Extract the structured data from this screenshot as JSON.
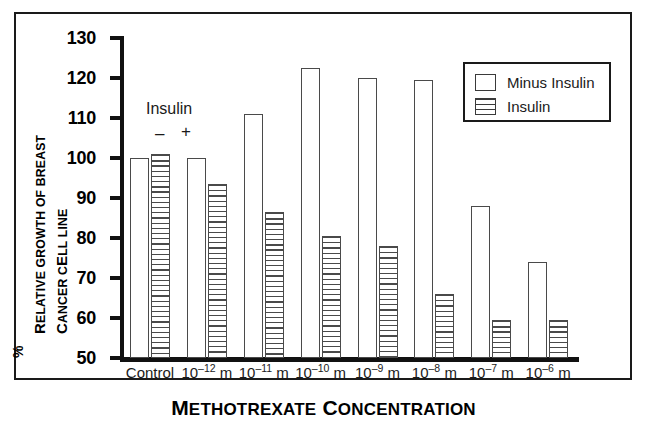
{
  "chart_data": {
    "type": "bar",
    "title": "",
    "xlabel": "Methotrexate Concentration",
    "ylabel": "% Relative Growth of Breast Cancer Cell Line",
    "ylim": [
      50,
      130
    ],
    "ytick_values": [
      130,
      120,
      110,
      100,
      90,
      80,
      70,
      60,
      50
    ],
    "ytick_labels": [
      "130",
      "120",
      "110",
      "100",
      "90",
      "80",
      "70",
      "60",
      "50"
    ],
    "grid": false,
    "legend_position": "top-right",
    "categories": [
      "Control",
      "10-12 m",
      "10-11 m",
      "10-10 m",
      "10-9 m",
      "10-8 m",
      "10-7 m",
      "10-6 m"
    ],
    "category_labels": [
      {
        "base": "Control",
        "exp": ""
      },
      {
        "base": "10",
        "exp": "–12",
        "unit": " m"
      },
      {
        "base": "10",
        "exp": "–11",
        "unit": " m"
      },
      {
        "base": "10",
        "exp": "–10",
        "unit": " m"
      },
      {
        "base": "10",
        "exp": "–9",
        "unit": " m"
      },
      {
        "base": "10",
        "exp": "–8",
        "unit": " m"
      },
      {
        "base": "10",
        "exp": "–7",
        "unit": " m"
      },
      {
        "base": "10",
        "exp": "–6",
        "unit": " m"
      }
    ],
    "series": [
      {
        "name": "Minus Insulin",
        "fill": "white",
        "values": [
          100,
          100,
          111,
          122.5,
          120,
          119.5,
          88,
          74
        ]
      },
      {
        "name": "Insulin",
        "fill": "horizontal-stripes",
        "values": [
          101,
          93.5,
          86.5,
          80.5,
          78,
          66,
          59.5,
          59.5
        ]
      }
    ]
  },
  "axis": {
    "y_title_prefix": "%",
    "y_title_line1": "Relative Growth of Breast",
    "y_title_line2": "Cancer Cell Line",
    "y_title_line1_caps": "R",
    "y_title_line2_caps": "C",
    "x_title": "Methotrexate Concentration"
  },
  "legend": {
    "items": [
      {
        "label": "Minus Insulin",
        "swatch": "empty-box"
      },
      {
        "label": "Insulin",
        "swatch": "striped-box"
      }
    ]
  },
  "annotation": {
    "insulin_label": "Insulin",
    "minus_sign": "–",
    "plus_sign": "+"
  },
  "colors": {
    "axis": "#111111",
    "bar_outline": "#4a4a4a",
    "frame": "#1a1a1a",
    "background": "#ffffff"
  }
}
